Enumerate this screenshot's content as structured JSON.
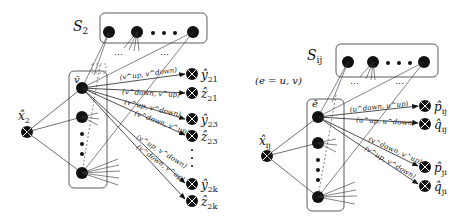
{
  "left_panel": {
    "set_label": "S",
    "set_sub": "2",
    "group_label": "v̄",
    "input_label": "x̂",
    "input_sub": "2",
    "outputs": [
      {
        "name": "ŷ",
        "sub": "21"
      },
      {
        "name": "ẑ",
        "sub": "21"
      },
      {
        "name": "ŷ",
        "sub": "23"
      },
      {
        "name": "ẑ",
        "sub": "23"
      },
      {
        "name": "ŷ",
        "sub": "2k"
      },
      {
        "name": "ẑ",
        "sub": "2k"
      }
    ],
    "edge_labels": [
      "(v^up, v^down)",
      "(v^down, v^up)",
      "(v^up, v^down)",
      "(v^down, v^up)",
      "(v^up, v^down)",
      "(v^down, v^up)"
    ],
    "ellipsis": "⋯"
  },
  "right_panel": {
    "set_label": "S",
    "set_sub": "ij",
    "edge_def": "(e = u, v)",
    "group_label": "ē",
    "input_label": "x̂",
    "input_sub": "ij",
    "outputs": [
      {
        "name": "p̂",
        "sub": "ij"
      },
      {
        "name": "q̂",
        "sub": "ij"
      },
      {
        "name": "p̂",
        "sub": "ji"
      },
      {
        "name": "q̂",
        "sub": "ji"
      }
    ],
    "edge_labels": [
      "(u^down, u^up)",
      "(u^up, u^down)",
      "(v^down, v^up)",
      "(v^up, v^down)"
    ],
    "ellipsis": "⋯"
  }
}
